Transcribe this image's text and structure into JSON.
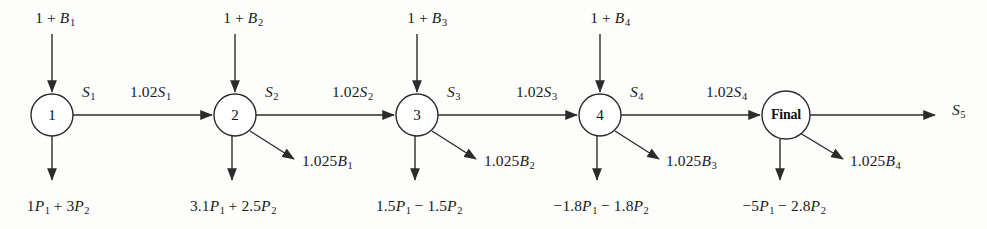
{
  "diagram": {
    "type": "flow-network",
    "canvas": {
      "width": 987,
      "height": 229
    },
    "style": {
      "stroke_color": "#2b2b2b",
      "text_color": "#1a1a1a",
      "background": "#fdfdfc",
      "node_radius": 21,
      "stroke_width": 1.4
    },
    "nodes": [
      {
        "id": "n1",
        "label": "1",
        "cx": 52,
        "cy": 115,
        "r": 21,
        "bold": false
      },
      {
        "id": "n2",
        "label": "2",
        "cx": 235,
        "cy": 115,
        "r": 21,
        "bold": false
      },
      {
        "id": "n3",
        "label": "3",
        "cx": 417,
        "cy": 115,
        "r": 21,
        "bold": false
      },
      {
        "id": "n4",
        "label": "4",
        "cx": 600,
        "cy": 115,
        "r": 21,
        "bold": false
      },
      {
        "id": "n5",
        "label": "Final",
        "cx": 786,
        "cy": 115,
        "r": 24,
        "bold": true
      }
    ],
    "inflow_labels": [
      {
        "id": "in1",
        "text_html": "1 + <i class=\"v\">B</i><sub>1</sub>",
        "text": "1 + B1",
        "x": 55,
        "y": 10
      },
      {
        "id": "in2",
        "text_html": "1 + <i class=\"v\">B</i><sub>2</sub>",
        "text": "1 + B2",
        "x": 243,
        "y": 10
      },
      {
        "id": "in3",
        "text_html": "1 + <i class=\"v\">B</i><sub>3</sub>",
        "text": "1 + B3",
        "x": 427,
        "y": 10
      },
      {
        "id": "in4",
        "text_html": "1 + <i class=\"v\">B</i><sub>4</sub>",
        "text": "1 + B4",
        "x": 610,
        "y": 10
      }
    ],
    "flow_labels": [
      {
        "id": "f_s1",
        "text_html": "<i class=\"v\">S</i><sub>1</sub>",
        "text": "S1",
        "x": 82,
        "y": 84
      },
      {
        "id": "f_102s1",
        "text_html": "1.02<i class=\"v\">S</i><sub>1</sub>",
        "text": "1.02S1",
        "x": 130,
        "y": 84
      },
      {
        "id": "f_s2",
        "text_html": "<i class=\"v\">S</i><sub>2</sub>",
        "text": "S2",
        "x": 265,
        "y": 84
      },
      {
        "id": "f_102s2",
        "text_html": "1.02<i class=\"v\">S</i><sub>2</sub>",
        "text": "1.02S2",
        "x": 332,
        "y": 84
      },
      {
        "id": "f_s3",
        "text_html": "<i class=\"v\">S</i><sub>3</sub>",
        "text": "S3",
        "x": 447,
        "y": 84
      },
      {
        "id": "f_102s3",
        "text_html": "1.02<i class=\"v\">S</i><sub>3</sub>",
        "text": "1.02S3",
        "x": 516,
        "y": 84
      },
      {
        "id": "f_s4",
        "text_html": "<i class=\"v\">S</i><sub>4</sub>",
        "text": "S4",
        "x": 630,
        "y": 84
      },
      {
        "id": "f_102s4",
        "text_html": "1.02<i class=\"v\">S</i><sub>4</sub>",
        "text": "1.02S4",
        "x": 706,
        "y": 84
      },
      {
        "id": "f_s5",
        "text_html": "<i class=\"v\">S</i><sub>5</sub>",
        "text": "S5",
        "x": 952,
        "y": 102
      }
    ],
    "waste_labels": [
      {
        "id": "w1",
        "text_html": "1.025<i class=\"v\">B</i><sub>1</sub>",
        "text": "1.025B1",
        "x": 302,
        "y": 153
      },
      {
        "id": "w2",
        "text_html": "1.025<i class=\"v\">B</i><sub>2</sub>",
        "text": "1.025B2",
        "x": 484,
        "y": 153
      },
      {
        "id": "w3",
        "text_html": "1.025<i class=\"v\">B</i><sub>3</sub>",
        "text": "1.025B3",
        "x": 666,
        "y": 153
      },
      {
        "id": "w4",
        "text_html": "1.025<i class=\"v\">B</i><sub>4</sub>",
        "text": "1.025B4",
        "x": 850,
        "y": 153
      }
    ],
    "outflow_labels": [
      {
        "id": "o1",
        "text_html": "1<i class=\"v\">P</i><sub>1</sub> + 3<i class=\"v\">P</i><sub>2</sub>",
        "text": "1P1 + 3P2",
        "x": 58,
        "y": 198
      },
      {
        "id": "o2",
        "text_html": "3.1<i class=\"v\">P</i><sub>1</sub> + 2.5<i class=\"v\">P</i><sub>2</sub>",
        "text": "3.1P1 + 2.5P2",
        "x": 233,
        "y": 198
      },
      {
        "id": "o3",
        "text_html": "1.5<i class=\"v\">P</i><sub>1</sub> − 1.5<i class=\"v\">P</i><sub>2</sub>",
        "text": "1.5P1 - 1.5P2",
        "x": 419,
        "y": 198
      },
      {
        "id": "o4",
        "text_html": "−1.8<i class=\"v\">P</i><sub>1</sub> − 1.8<i class=\"v\">P</i><sub>2</sub>",
        "text": "-1.8P1 - 1.8P2",
        "x": 601,
        "y": 198
      },
      {
        "id": "o5",
        "text_html": "−5<i class=\"v\">P</i><sub>1</sub> − 2.8<i class=\"v\">P</i><sub>2</sub>",
        "text": "-5P1 - 2.8P2",
        "x": 784,
        "y": 198
      }
    ],
    "edges": {
      "inflow_arrows": [
        {
          "id": "a_in1",
          "x1": 52,
          "y1": 34,
          "x2": 52,
          "y2": 92
        },
        {
          "id": "a_in2",
          "x1": 235,
          "y1": 34,
          "x2": 235,
          "y2": 92
        },
        {
          "id": "a_in3",
          "x1": 417,
          "y1": 34,
          "x2": 417,
          "y2": 92
        },
        {
          "id": "a_in4",
          "x1": 600,
          "y1": 34,
          "x2": 600,
          "y2": 92
        }
      ],
      "horizontal_arrows": [
        {
          "id": "a_h1",
          "x1": 73,
          "y1": 115,
          "x2": 212,
          "y2": 115
        },
        {
          "id": "a_h2",
          "x1": 256,
          "y1": 115,
          "x2": 394,
          "y2": 115
        },
        {
          "id": "a_h3",
          "x1": 438,
          "y1": 115,
          "x2": 577,
          "y2": 115
        },
        {
          "id": "a_h4",
          "x1": 621,
          "y1": 115,
          "x2": 760,
          "y2": 115
        },
        {
          "id": "a_h5",
          "x1": 810,
          "y1": 115,
          "x2": 935,
          "y2": 115
        }
      ],
      "outflow_arrows": [
        {
          "id": "a_o1",
          "x1": 52,
          "y1": 136,
          "x2": 52,
          "y2": 180
        },
        {
          "id": "a_o2",
          "x1": 232,
          "y1": 136,
          "x2": 232,
          "y2": 180
        },
        {
          "id": "a_o3",
          "x1": 415,
          "y1": 136,
          "x2": 415,
          "y2": 180
        },
        {
          "id": "a_o4",
          "x1": 597,
          "y1": 136,
          "x2": 597,
          "y2": 180
        },
        {
          "id": "a_o5",
          "x1": 780,
          "y1": 139,
          "x2": 780,
          "y2": 180
        }
      ],
      "waste_arrows": [
        {
          "id": "a_w1",
          "x1": 250,
          "y1": 131,
          "x2": 294,
          "y2": 159
        },
        {
          "id": "a_w2",
          "x1": 432,
          "y1": 131,
          "x2": 476,
          "y2": 159
        },
        {
          "id": "a_w3",
          "x1": 615,
          "y1": 131,
          "x2": 659,
          "y2": 159
        },
        {
          "id": "a_w4",
          "x1": 800,
          "y1": 133,
          "x2": 843,
          "y2": 159
        }
      ]
    }
  }
}
